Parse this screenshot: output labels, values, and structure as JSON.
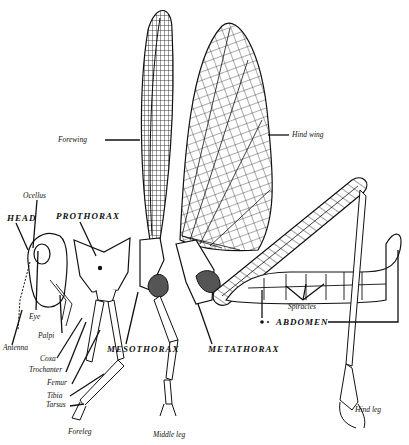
{
  "figure": {
    "colors": {
      "ink": "#111111",
      "paper": "#ffffff",
      "shade": "#555555"
    },
    "labels": {
      "forewing": "Forewing",
      "hind_wing": "Hind wing",
      "ocellus": "Ocellus",
      "head": "HEAD",
      "prothorax": "PROTHORAX",
      "eye": "Eye",
      "palpi": "Palpi",
      "antenna": "Antenna",
      "coxa": "Coxa",
      "trochanter": "Trochanter",
      "femur": "Femur",
      "tibia": "Tibia",
      "tarsus": "Tarsus",
      "foreleg": "Foreleg",
      "middle_leg": "Middle leg",
      "mesothorax": "MESOTHORAX",
      "metathorax": "METATHORAX",
      "spiracles": "Spiracles",
      "abdomen": "ABDOMEN",
      "hind_leg": "Hind leg"
    }
  }
}
